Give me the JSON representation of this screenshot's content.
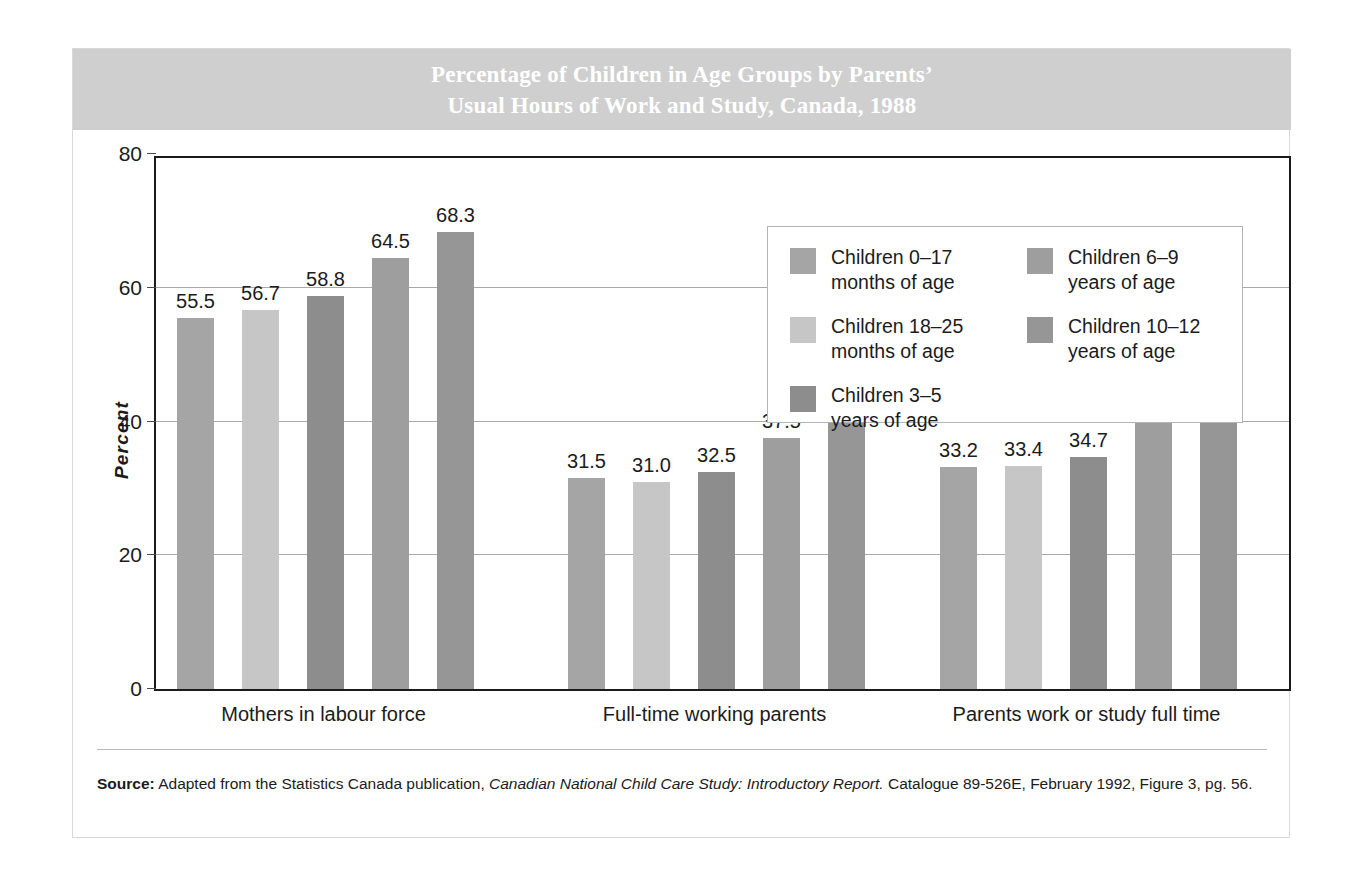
{
  "figure": {
    "title": "Percentage of Children in Age Groups by Parents’\nUsual Hours of Work and Study, Canada, 1988",
    "banner_color": "#cfcfcf",
    "frame_color": "#d8d8d8"
  },
  "axis": {
    "y_title": "Percent",
    "y_ticks": [
      "0",
      "20",
      "40",
      "60",
      "80"
    ],
    "y_min": 0,
    "y_max": 80
  },
  "legend": {
    "items": [
      {
        "label": "Children 0–17\nmonths of age",
        "color": "#a5a5a5"
      },
      {
        "label": "Children 18–25\nmonths of age",
        "color": "#c6c6c6"
      },
      {
        "label": "Children 3–5\nyears of age",
        "color": "#8d8d8d"
      },
      {
        "label": "Children 6–9\nyears of age",
        "color": "#9e9e9e"
      },
      {
        "label": "Children 10–12\nyears of age",
        "color": "#969696"
      }
    ]
  },
  "source": {
    "prefix": "Source:",
    "text_1": " Adapted from the Statistics Canada publication, ",
    "italic": "Canadian National Child Care Study: Introductory Report.",
    "text_2": " Catalogue 89-526E, February 1992, Figure 3, pg. 56."
  },
  "chart_data": {
    "type": "bar",
    "title": "Percentage of Children in Age Groups by Parents’ Usual Hours of Work and Study, Canada, 1988",
    "xlabel": "",
    "ylabel": "Percent",
    "ylim": [
      0,
      80
    ],
    "yticks": [
      0,
      20,
      40,
      60,
      80
    ],
    "grid": true,
    "legend_position": "inside-top-right",
    "categories": [
      "Mothers in labour force",
      "Full-time working parents",
      "Parents work or study full time"
    ],
    "series": [
      {
        "name": "Children 0–17 months of age",
        "color": "#a5a5a5",
        "values": [
          55.5,
          31.5,
          33.2
        ]
      },
      {
        "name": "Children 18–25 months of age",
        "color": "#c6c6c6",
        "values": [
          56.7,
          31.0,
          33.4
        ]
      },
      {
        "name": "Children 3–5 years of age",
        "color": "#8d8d8d",
        "values": [
          58.8,
          32.5,
          34.7
        ]
      },
      {
        "name": "Children 6–9 years of age",
        "color": "#9e9e9e",
        "values": [
          64.5,
          37.5,
          40.1
        ]
      },
      {
        "name": "Children 10–12 years of age",
        "color": "#969696",
        "values": [
          68.3,
          41.9,
          44.1
        ]
      }
    ],
    "data_labels": [
      [
        "55.5",
        "56.7",
        "58.8",
        "64.5",
        "68.3"
      ],
      [
        "31.5",
        "31.0",
        "32.5",
        "37.5",
        "41.9"
      ],
      [
        "33.2",
        "33.4",
        "34.7",
        "40.1",
        "44.1"
      ]
    ]
  }
}
